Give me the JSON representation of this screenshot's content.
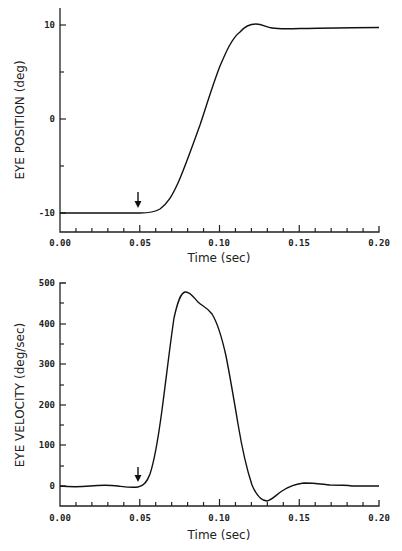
{
  "chart_data": [
    {
      "type": "line",
      "title": "",
      "xlabel": "Time (sec)",
      "ylabel": "EYE POSITION (deg)",
      "xlim": [
        0,
        0.2
      ],
      "ylim": [
        -12,
        12
      ],
      "x_ticks": [
        "0.00",
        "0.05",
        "0.10",
        "0.15",
        "0.20"
      ],
      "y_ticks": [
        "-10",
        "0",
        "10"
      ],
      "grid": false,
      "annotations": [
        {
          "type": "arrow-down",
          "x": 0.05,
          "note": "saccade onset marker"
        }
      ],
      "series": [
        {
          "name": "eye position",
          "x": [
            0.0,
            0.02,
            0.04,
            0.05,
            0.055,
            0.06,
            0.065,
            0.07,
            0.075,
            0.08,
            0.085,
            0.09,
            0.095,
            0.1,
            0.105,
            0.11,
            0.115,
            0.12,
            0.125,
            0.13,
            0.135,
            0.14,
            0.15,
            0.17,
            0.2
          ],
          "values": [
            -10,
            -10,
            -10,
            -10,
            -9.9,
            -9.5,
            -8.7,
            -7.5,
            -5.8,
            -3.8,
            -1.7,
            0.4,
            2.6,
            4.7,
            6.6,
            8.2,
            9.4,
            10.0,
            10.1,
            9.9,
            9.7,
            9.6,
            9.6,
            9.7,
            9.8
          ]
        }
      ]
    },
    {
      "type": "line",
      "title": "",
      "xlabel": "Time (sec)",
      "ylabel": "EYE VELOCITY (deg/sec)",
      "xlim": [
        0,
        0.2
      ],
      "ylim": [
        -50,
        500
      ],
      "x_ticks": [
        "0.00",
        "0.05",
        "0.10",
        "0.15",
        "0.20"
      ],
      "y_ticks": [
        "0",
        "100",
        "200",
        "300",
        "400",
        "500"
      ],
      "grid": false,
      "annotations": [
        {
          "type": "arrow-down",
          "x": 0.05,
          "note": "saccade onset marker"
        }
      ],
      "series": [
        {
          "name": "eye velocity",
          "x": [
            0.0,
            0.01,
            0.02,
            0.03,
            0.04,
            0.045,
            0.05,
            0.055,
            0.06,
            0.065,
            0.07,
            0.075,
            0.078,
            0.082,
            0.086,
            0.09,
            0.095,
            0.1,
            0.105,
            0.11,
            0.115,
            0.12,
            0.125,
            0.13,
            0.135,
            0.14,
            0.145,
            0.15,
            0.16,
            0.17,
            0.18,
            0.19,
            0.2
          ],
          "values": [
            0,
            -2,
            3,
            1,
            -3,
            -5,
            0,
            30,
            130,
            280,
            410,
            465,
            478,
            465,
            448,
            438,
            410,
            340,
            240,
            130,
            40,
            -15,
            -35,
            -37,
            -20,
            0,
            8,
            10,
            8,
            6,
            2,
            3,
            3
          ]
        }
      ]
    }
  ],
  "plots": {
    "top": {
      "ylabel": "EYE POSITION (deg)",
      "xlabel": "Time (sec)",
      "yticks": [
        "10",
        "0",
        "-10"
      ],
      "xticks": [
        "0.00",
        "0.05",
        "0.10",
        "0.15",
        "0.20"
      ]
    },
    "bottom": {
      "ylabel": "EYE VELOCITY (deg/sec)",
      "xlabel": "Time (sec)",
      "yticks": [
        "500",
        "400",
        "300",
        "200",
        "100",
        "0"
      ],
      "xticks": [
        "0.00",
        "0.05",
        "0.10",
        "0.15",
        "0.20"
      ]
    }
  }
}
